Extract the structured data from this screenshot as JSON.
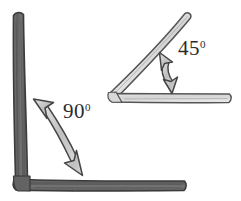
{
  "figure": {
    "background_color": "#ffffff",
    "style": "hand-drawn pencil sketch"
  },
  "shapes": [
    {
      "id": "right-angle-corner",
      "name": "ninety-degree-corner",
      "description": "Large dark L-shaped corner made of two thick bars meeting at a right angle",
      "fill_color": "#6e6e6e",
      "stroke_color": "#3a3a3a",
      "vertex": {
        "x": 22,
        "y": 180
      },
      "arms": [
        {
          "name": "vertical-arm",
          "from": {
            "x": 17,
            "y": 14
          },
          "to": {
            "x": 22,
            "y": 180
          },
          "thickness": 11
        },
        {
          "name": "horizontal-arm",
          "from": {
            "x": 22,
            "y": 186
          },
          "to": {
            "x": 186,
            "y": 186
          },
          "thickness": 11
        }
      ]
    },
    {
      "id": "acute-angle-corner",
      "name": "forty-five-degree-corner",
      "description": "Light gray V-shaped corner with a diagonal arm rising at 45 degrees from a horizontal arm",
      "fill_color": "#dcdcdc",
      "stroke_color": "#555555",
      "vertex": {
        "x": 111,
        "y": 96
      },
      "arms": [
        {
          "name": "diagonal-arm",
          "from": {
            "x": 111,
            "y": 96
          },
          "to": {
            "x": 188,
            "y": 15
          },
          "thickness": 9
        },
        {
          "name": "horizontal-arm",
          "from": {
            "x": 111,
            "y": 99
          },
          "to": {
            "x": 231,
            "y": 99
          },
          "thickness": 9
        }
      ]
    }
  ],
  "arrows": [
    {
      "id": "arrow-90",
      "name": "ninety-degree-angle-arrow",
      "description": "Curved double-headed arrow spanning the right angle, from upper-left to lower-right",
      "fill_color": "#c9c9c9",
      "stroke_color": "#444444",
      "double_headed": true,
      "start": {
        "x": 38,
        "y": 104
      },
      "end": {
        "x": 76,
        "y": 170
      }
    },
    {
      "id": "arrow-45",
      "name": "forty-five-degree-angle-arrow",
      "description": "Curved double-headed arrow spanning the acute angle, nearly vertical",
      "fill_color": "#c9c9c9",
      "stroke_color": "#444444",
      "double_headed": true,
      "start": {
        "x": 160,
        "y": 57
      },
      "end": {
        "x": 172,
        "y": 90
      }
    }
  ],
  "labels": {
    "angle_ninety": {
      "value": "90",
      "degree_symbol": "0",
      "full_text": "90°"
    },
    "angle_fortyfive": {
      "value": "45",
      "degree_symbol": "0",
      "full_text": "45°"
    }
  },
  "colors": {
    "background": "#ffffff",
    "dark_bar": "#6e6e6e",
    "dark_bar_outline": "#3a3a3a",
    "light_bar": "#dcdcdc",
    "light_bar_outline": "#555555",
    "arrow_fill": "#c9c9c9",
    "arrow_outline": "#444444",
    "text": "#2b2b2b"
  }
}
